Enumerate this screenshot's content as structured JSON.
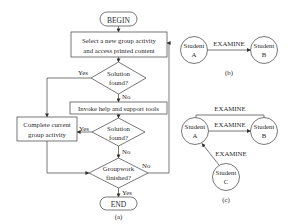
{
  "flowchart": {
    "caption": "(a)",
    "begin": "BEGIN",
    "end": "END",
    "select_box": [
      "Select a new group activity",
      "and access printed content"
    ],
    "decision1": [
      "Solution",
      "found?"
    ],
    "decision1_yes": "Yes",
    "decision1_no": "No",
    "invoke_box": "Invoke help and support tools",
    "decision2": [
      "Solution",
      "found?"
    ],
    "decision2_yes": "Yes",
    "decision2_no": "No",
    "complete_box": [
      "Complete current",
      "group activity"
    ],
    "decision3": [
      "Groupwork",
      "finished?"
    ],
    "decision3_yes": "Yes",
    "decision3_no": "No"
  },
  "diagram_b": {
    "caption": "(b)",
    "node_a": [
      "Student",
      "A"
    ],
    "node_b": [
      "Student",
      "B"
    ],
    "edge_label": "EXAMINE"
  },
  "diagram_c": {
    "caption": "(c)",
    "node_a": [
      "Student",
      "A"
    ],
    "node_b": [
      "Student",
      "B"
    ],
    "node_c": [
      "Student",
      "C"
    ],
    "edge_top_label": "EXAMINE",
    "edge_ab_label": "EXAMINE",
    "edge_ca_label": "EXAMINE"
  }
}
